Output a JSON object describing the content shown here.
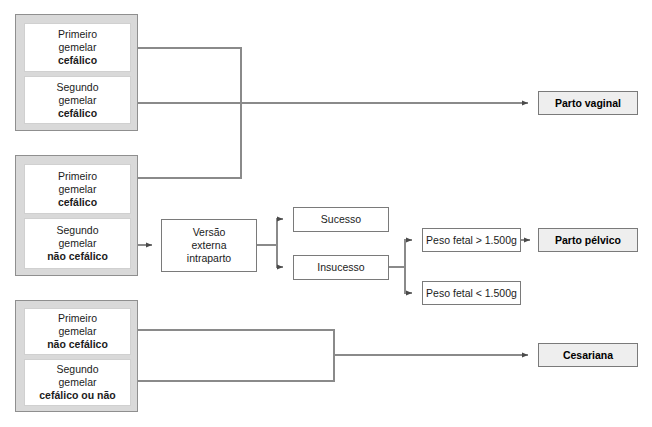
{
  "diagram": {
    "colors": {
      "group_fill": "#d9d9d9",
      "group_border": "#8f8f8f",
      "node_fill": "#ffffff",
      "node_border": "#d0d0d0",
      "plain_border": "#7a7a7a",
      "outcome_fill": "#eeeeee",
      "line": "#808080",
      "text": "#1b1b1b"
    },
    "groups": [
      {
        "id": "group-1",
        "nodes": [
          {
            "id": "g1-first",
            "line1": "Primeiro",
            "line2": "gemelar",
            "emphasis": "cefálico"
          },
          {
            "id": "g1-second",
            "line1": "Segundo",
            "line2": "gemelar",
            "emphasis": "cefálico"
          }
        ]
      },
      {
        "id": "group-2",
        "nodes": [
          {
            "id": "g2-first",
            "line1": "Primeiro",
            "line2": "gemelar",
            "emphasis": "cefálico"
          },
          {
            "id": "g2-second",
            "line1": "Segundo",
            "line2": "gemelar",
            "emphasis": "não cefálico"
          }
        ]
      },
      {
        "id": "group-3",
        "nodes": [
          {
            "id": "g3-first",
            "line1": "Primeiro",
            "line2": "gemelar",
            "emphasis": "não cefálico"
          },
          {
            "id": "g3-second",
            "line1": "Segundo",
            "line2": "gemelar",
            "emphasis": "cefálico ou não"
          }
        ]
      }
    ],
    "process": {
      "versao": {
        "line1": "Versão",
        "line2": "externa",
        "line3": "intraparto"
      }
    },
    "results": {
      "sucesso": "Sucesso",
      "insucesso": "Insucesso",
      "peso_maior": "Peso fetal > 1.500g",
      "peso_menor": "Peso fetal < 1.500g"
    },
    "outcomes": {
      "parto_vaginal": "Parto vaginal",
      "parto_pelvico": "Parto pélvico",
      "cesariana": "Cesariana"
    }
  }
}
